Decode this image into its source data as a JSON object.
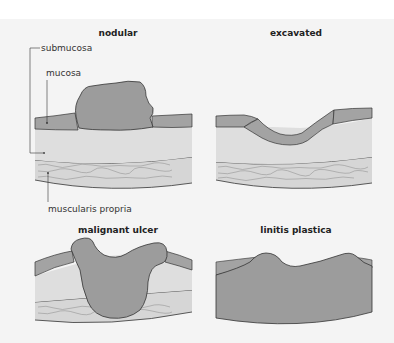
{
  "figure": {
    "panels": [
      {
        "id": "nodular",
        "title": "nodular"
      },
      {
        "id": "excavated",
        "title": "excavated"
      },
      {
        "id": "malignant-ulcer",
        "title": "malignant ulcer"
      },
      {
        "id": "linitis-plastica",
        "title": "linitis plastica"
      }
    ],
    "labels": {
      "submucosa": "submucosa",
      "mucosa": "mucosa",
      "muscularis": "muscularis propria"
    },
    "colors": {
      "background": "#f4f4f4",
      "tumor": "#9c9c9c",
      "mucosa": "#a3a3a3",
      "submucosa": "#dedede",
      "muscularis": "#d6d6d6",
      "outline": "#333333"
    }
  }
}
